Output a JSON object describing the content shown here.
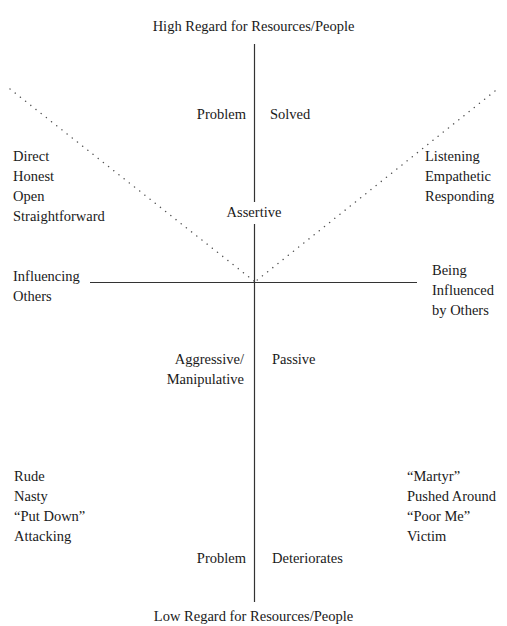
{
  "diagram": {
    "title_top": "High Regard for Resources/People",
    "title_bottom": "Low Regard for Resources/People",
    "axes": {
      "horizontal_left": [
        "Influencing",
        "Others"
      ],
      "horizontal_right": [
        "Being",
        "Influenced",
        "by Others"
      ]
    },
    "upper": {
      "problem_label": "Problem",
      "solved_label": "Solved",
      "assertive_label": "Assertive",
      "left_traits": [
        "Direct",
        "Honest",
        "Open",
        "Straightforward"
      ],
      "right_traits": [
        "Listening",
        "Empathetic",
        "Responding"
      ]
    },
    "lower": {
      "aggressive_label": [
        "Aggressive/",
        "Manipulative"
      ],
      "passive_label": "Passive",
      "left_traits": [
        "Rude",
        "Nasty",
        "“Put Down”",
        "Attacking"
      ],
      "right_traits": [
        "“Martyr”",
        "Pushed Around",
        "“Poor Me”",
        "Victim"
      ],
      "problem_label": "Problem",
      "deteriorates_label": "Deteriorates"
    },
    "colors": {
      "line": "#333333",
      "dots": "#555555",
      "text": "#1a1a1a"
    }
  }
}
